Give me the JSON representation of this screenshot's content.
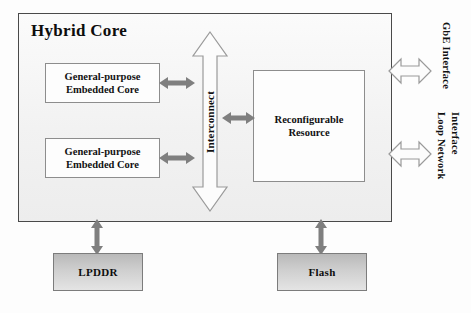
{
  "figure": {
    "container": {
      "title": "Hybrid Core"
    },
    "blocks": [
      {
        "id": "core-1",
        "label_line1": "General-purpose",
        "label_line2": "Embedded Core"
      },
      {
        "id": "core-2",
        "label_line1": "General-purpose",
        "label_line2": "Embedded Core"
      },
      {
        "id": "reconfigurable",
        "label_line1": "Reconfigurable",
        "label_line2": "Resource"
      }
    ],
    "interconnect": {
      "label": "Interconnect"
    },
    "memory": [
      {
        "id": "lpddr",
        "label": "LPDDR"
      },
      {
        "id": "flash",
        "label": "Flash"
      }
    ],
    "interfaces": [
      {
        "id": "gbe",
        "label": "GbE Interface",
        "line1": "GbE Interface",
        "line2": ""
      },
      {
        "id": "loop-network",
        "label": "Loop Network Interface",
        "line1": "Loop Network",
        "line2": "Interface"
      }
    ],
    "colors": {
      "container_fill": "#f2f2f2",
      "container_border": "#4a4a4a",
      "box_fill": "#fdfdfd",
      "box_border": "#8d8d8d",
      "memory_fill_top": "#b9b9b9",
      "memory_fill_bottom": "#e4e4e4",
      "arrow_gray": "#7f7f7f",
      "arrow_outline": "#9a9a9a",
      "text": "#111111"
    }
  }
}
